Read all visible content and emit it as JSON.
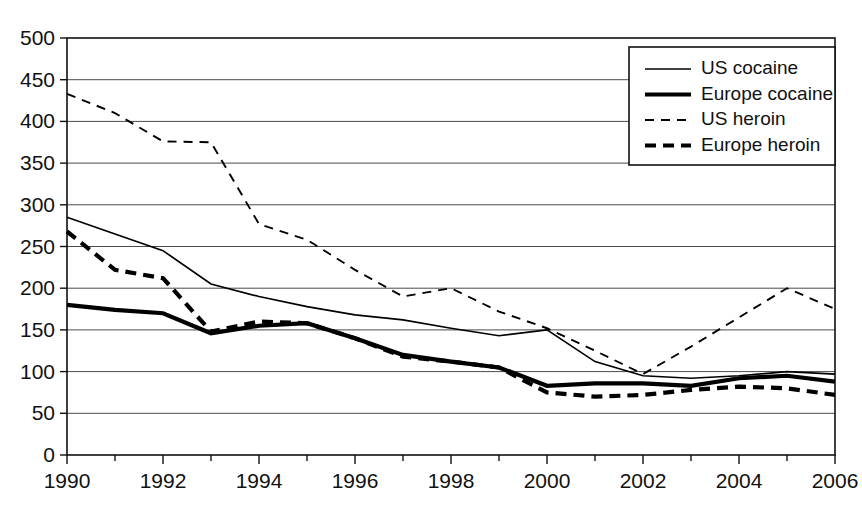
{
  "chart_data": {
    "type": "line",
    "title": "",
    "subtitle": "",
    "xlabel": "",
    "ylabel": "",
    "xlim": [
      1990,
      2006
    ],
    "ylim": [
      0,
      500
    ],
    "ytick_step": 50,
    "xtick_step": 2,
    "minor_xticks": true,
    "grid": "horizontal",
    "legend_position": "top-right",
    "x": [
      1990,
      1991,
      1992,
      1993,
      1994,
      1995,
      1996,
      1997,
      1998,
      1999,
      2000,
      2001,
      2002,
      2003,
      2004,
      2005,
      2006
    ],
    "xtick_labels": [
      "1990",
      "1992",
      "1994",
      "1996",
      "1998",
      "2000",
      "2002",
      "2004",
      "2006"
    ],
    "ytick_labels": [
      "0",
      "50",
      "100",
      "150",
      "200",
      "250",
      "300",
      "350",
      "400",
      "450",
      "500"
    ],
    "series": [
      {
        "name": "US cocaine",
        "style": "thin-solid",
        "values": [
          285,
          265,
          245,
          205,
          190,
          178,
          168,
          162,
          152,
          143,
          150,
          112,
          95,
          92,
          95,
          100,
          97
        ]
      },
      {
        "name": "Europe cocaine",
        "style": "thick-solid",
        "values": [
          180,
          174,
          170,
          146,
          155,
          158,
          140,
          120,
          112,
          105,
          83,
          86,
          86,
          83,
          92,
          95,
          88
        ]
      },
      {
        "name": "US heroin",
        "style": "thin-dashed",
        "values": [
          433,
          410,
          376,
          375,
          277,
          258,
          222,
          190,
          200,
          172,
          152,
          125,
          97,
          130,
          165,
          200,
          175
        ]
      },
      {
        "name": "Europe heroin",
        "style": "thick-dashed",
        "values": [
          268,
          222,
          212,
          148,
          160,
          158,
          140,
          118,
          112,
          105,
          75,
          70,
          72,
          78,
          82,
          80,
          72
        ]
      }
    ]
  },
  "legend": {
    "items": [
      {
        "label": "US cocaine",
        "style": "thin-solid"
      },
      {
        "label": "Europe cocaine",
        "style": "thick-solid"
      },
      {
        "label": "US heroin",
        "style": "thin-dashed"
      },
      {
        "label": "Europe heroin",
        "style": "thick-dashed"
      }
    ]
  },
  "colors": {
    "line": "#000000",
    "grid": "#4b4b4b",
    "axis": "#111111",
    "background": "#ffffff"
  }
}
